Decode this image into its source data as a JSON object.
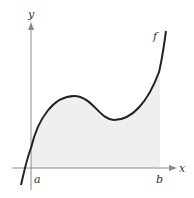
{
  "figure": {
    "axes": {
      "x_label": "x",
      "y_label": "y"
    },
    "function_label": "f",
    "bounds": {
      "lower": "a",
      "upper": "b"
    },
    "colors": {
      "curve": "#222222",
      "axis": "#8a8a8a",
      "shade": "#efefef"
    }
  }
}
